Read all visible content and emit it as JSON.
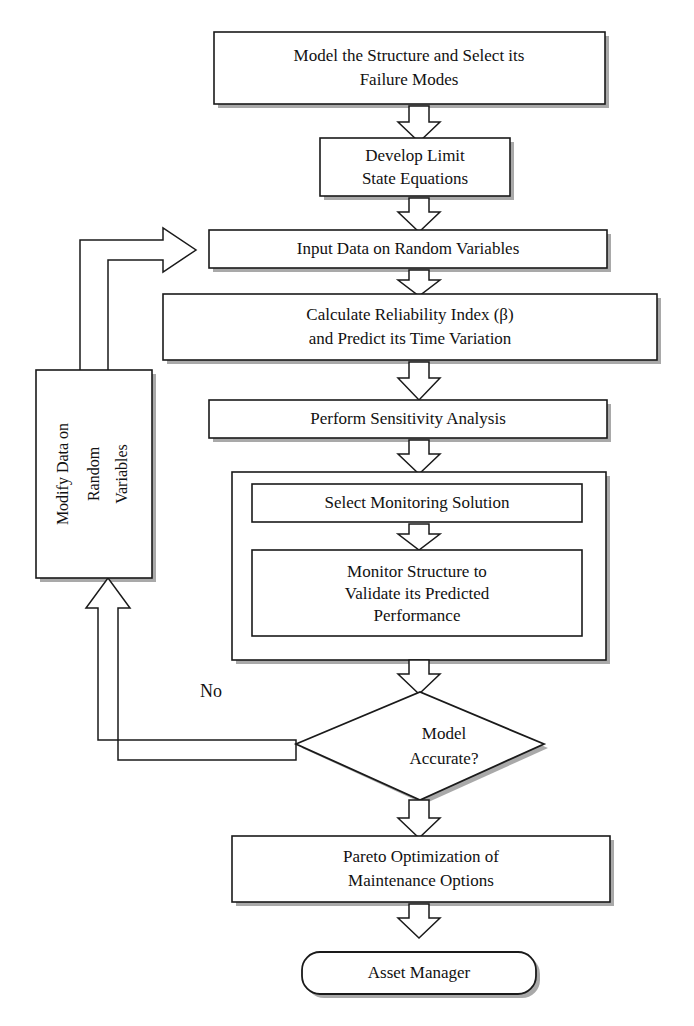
{
  "diagram": {
    "type": "flowchart",
    "orientation": "top-to-bottom",
    "background_color": "#ffffff",
    "line_color": "#1a1a1a",
    "shadow_color": "#9a9a9a"
  },
  "nodes": {
    "model_structure": {
      "shape": "rectangle",
      "lines": [
        "Model the Structure and Select its",
        "Failure Modes"
      ]
    },
    "develop_limit": {
      "shape": "rectangle",
      "lines": [
        "Develop Limit",
        "State Equations"
      ]
    },
    "input_data": {
      "shape": "rectangle",
      "lines": [
        "Input Data on Random Variables"
      ]
    },
    "calculate_reliability": {
      "shape": "rectangle",
      "lines": [
        "Calculate Reliability Index (β)",
        "and Predict its Time Variation"
      ]
    },
    "sensitivity": {
      "shape": "rectangle",
      "lines": [
        "Perform Sensitivity Analysis"
      ]
    },
    "monitoring_group": {
      "shape": "container",
      "lines": []
    },
    "select_monitoring": {
      "shape": "rectangle",
      "lines": [
        "Select Monitoring Solution"
      ]
    },
    "monitor_structure": {
      "shape": "rectangle",
      "lines": [
        "Monitor Structure to",
        "Validate its Predicted",
        "Performance"
      ]
    },
    "model_accurate": {
      "shape": "diamond",
      "lines": [
        "Model",
        "Accurate?"
      ]
    },
    "pareto": {
      "shape": "rectangle",
      "lines": [
        "Pareto Optimization of",
        "Maintenance Options"
      ]
    },
    "asset_manager": {
      "shape": "rounded-rectangle",
      "lines": [
        "Asset Manager"
      ]
    },
    "modify_data": {
      "shape": "rectangle-rotated",
      "lines": [
        "Modify Data on",
        "Random",
        "Variables"
      ]
    }
  },
  "edges": {
    "no_branch_label": "No"
  }
}
